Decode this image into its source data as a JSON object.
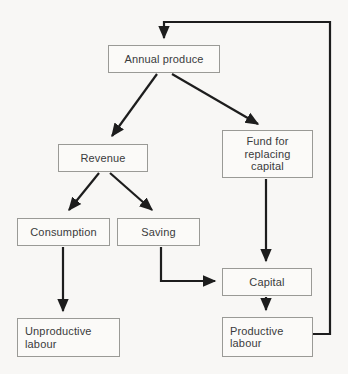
{
  "figure": {
    "type": "flowchart",
    "background_color": "#f8f7f5",
    "box_border_color": "#9a9a96",
    "text_color": "#3a3a3c",
    "arrow_color": "#1d1d1d"
  },
  "nodes": [
    {
      "id": "annual-produce",
      "label": "Annual produce",
      "x": 108,
      "y": 45,
      "w": 112,
      "h": 28,
      "align": "center"
    },
    {
      "id": "revenue",
      "label": "Revenue",
      "x": 58,
      "y": 144,
      "w": 90,
      "h": 28,
      "align": "center"
    },
    {
      "id": "fund-for-replacing-capital",
      "label": "Fund for\nreplacing\ncapital",
      "x": 222,
      "y": 130,
      "w": 91,
      "h": 48,
      "align": "center"
    },
    {
      "id": "consumption",
      "label": "Consumption",
      "x": 17,
      "y": 218,
      "w": 93,
      "h": 28,
      "align": "center"
    },
    {
      "id": "saving",
      "label": "Saving",
      "x": 117,
      "y": 218,
      "w": 83,
      "h": 28,
      "align": "center"
    },
    {
      "id": "capital",
      "label": "Capital",
      "x": 222,
      "y": 268,
      "w": 90,
      "h": 28,
      "align": "center"
    },
    {
      "id": "unproductive-labour",
      "label": "Unproductive\nlabour",
      "x": 17,
      "y": 318,
      "w": 103,
      "h": 39,
      "align": "left"
    },
    {
      "id": "productive-labour",
      "label": "Productive\nlabour",
      "x": 222,
      "y": 317,
      "w": 91,
      "h": 40,
      "align": "left"
    }
  ],
  "edges": [
    {
      "id": "annual-produce-to-revenue",
      "from": "annual-produce",
      "to": "revenue",
      "style": "diagonal"
    },
    {
      "id": "annual-produce-to-fund",
      "from": "annual-produce",
      "to": "fund-for-replacing-capital",
      "style": "diagonal"
    },
    {
      "id": "revenue-to-consumption",
      "from": "revenue",
      "to": "consumption",
      "style": "diagonal"
    },
    {
      "id": "revenue-to-saving",
      "from": "revenue",
      "to": "saving",
      "style": "diagonal"
    },
    {
      "id": "consumption-to-unproductive-labour",
      "from": "consumption",
      "to": "unproductive-labour",
      "style": "vertical"
    },
    {
      "id": "saving-to-capital",
      "from": "saving",
      "to": "capital",
      "style": "elbow"
    },
    {
      "id": "fund-to-capital",
      "from": "fund-for-replacing-capital",
      "to": "capital",
      "style": "vertical"
    },
    {
      "id": "capital-to-productive-labour",
      "from": "capital",
      "to": "productive-labour",
      "style": "vertical"
    },
    {
      "id": "productive-labour-to-annual-produce",
      "from": "productive-labour",
      "to": "annual-produce",
      "style": "feedback-loop"
    }
  ]
}
